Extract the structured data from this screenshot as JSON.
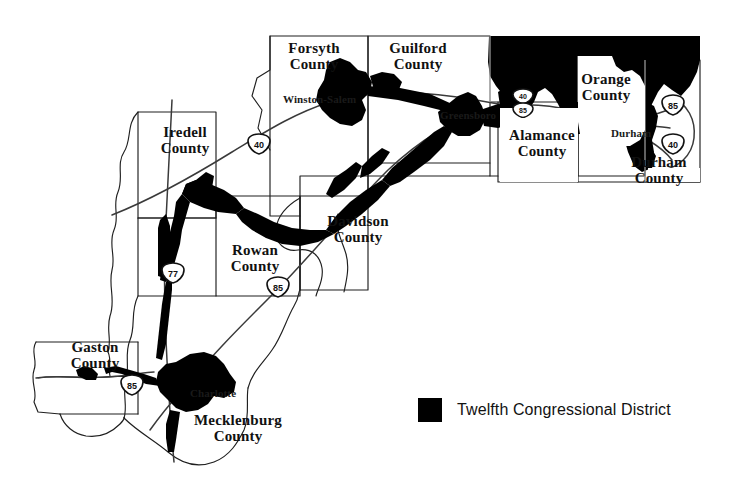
{
  "map": {
    "title": "Twelfth Congressional District",
    "region": "North Carolina",
    "background_color": "#ffffff",
    "district_fill_color": "#000000",
    "outline_color": "#1a1a1a",
    "counties": [
      {
        "name": "Iredell County",
        "label": "Iredell\nCounty",
        "x": 148,
        "y": 125
      },
      {
        "name": "Forsyth County",
        "label": "Forsyth\nCounty",
        "x": 277,
        "y": 41
      },
      {
        "name": "Guilford County",
        "label": "Guilford\nCounty",
        "x": 378,
        "y": 41
      },
      {
        "name": "Orange County",
        "label": "Orange\nCounty",
        "x": 568,
        "y": 72
      },
      {
        "name": "Alamance County",
        "label": "Alamance\nCounty",
        "x": 503,
        "y": 128
      },
      {
        "name": "Durham County",
        "label": "Durham\nCounty",
        "x": 619,
        "y": 155
      },
      {
        "name": "Davidson County",
        "label": "Davidson\nCounty",
        "x": 317,
        "y": 214
      },
      {
        "name": "Rowan County",
        "label": "Rowan\nCounty",
        "x": 218,
        "y": 243
      },
      {
        "name": "Gaston County",
        "label": "Gaston\nCounty",
        "x": 58,
        "y": 340
      },
      {
        "name": "Mecklenburg County",
        "label": "Mecklenburg\nCounty",
        "x": 188,
        "y": 413
      }
    ],
    "cities": [
      {
        "name": "Winston-Salem",
        "label": "Winston-Salem",
        "x": 283,
        "y": 93
      },
      {
        "name": "Greensboro",
        "label": "Greensboro",
        "x": 440,
        "y": 109
      },
      {
        "name": "Durham",
        "label": "Durham",
        "x": 611,
        "y": 127
      },
      {
        "name": "Charlotte",
        "label": "Charlotte",
        "x": 190,
        "y": 387
      }
    ],
    "interstate_shields": [
      {
        "name": "i-40-forsyth",
        "routes": [
          "40"
        ],
        "x": 246,
        "y": 133
      },
      {
        "name": "i-40-85-alamance",
        "routes": [
          "40",
          "85"
        ],
        "x": 523,
        "y": 93
      },
      {
        "name": "i-85-durham",
        "routes": [
          "85"
        ],
        "x": 662,
        "y": 97
      },
      {
        "name": "i-40-durham",
        "routes": [
          "40"
        ],
        "x": 662,
        "y": 136
      },
      {
        "name": "i-77-rowan",
        "routes": [
          "77"
        ],
        "x": 162,
        "y": 264
      },
      {
        "name": "i-85-rowan",
        "routes": [
          "85"
        ],
        "x": 267,
        "y": 278
      },
      {
        "name": "i-85-gaston",
        "routes": [
          "85"
        ],
        "x": 121,
        "y": 376
      }
    ]
  },
  "legend": {
    "label": "Twelfth Congressional District",
    "swatch_color": "#000000"
  }
}
